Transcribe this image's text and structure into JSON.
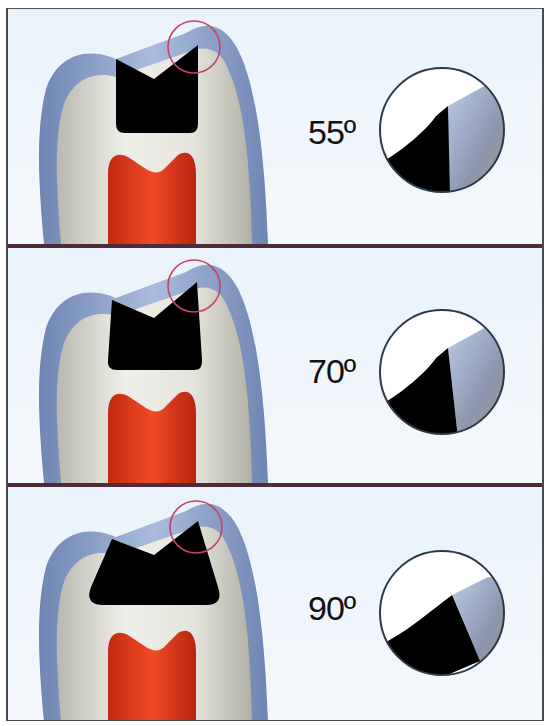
{
  "figure": {
    "colors": {
      "frame_border": "#4a4a4a",
      "separator": "#4d2b38",
      "background": "#eef5fb",
      "enamel": "#8fa6cc",
      "dentin": "#dcdcd4",
      "pulp": "#e2391c",
      "preparation": "#000000",
      "highlight_circle": "#c8436a",
      "magnifier_border": "#2a3a48"
    },
    "panels": [
      {
        "id": "panel-1",
        "angle_label": "55º",
        "angle_value": 55
      },
      {
        "id": "panel-2",
        "angle_label": "70º",
        "angle_value": 70
      },
      {
        "id": "panel-3",
        "angle_label": "90º",
        "angle_value": 90
      }
    ]
  }
}
